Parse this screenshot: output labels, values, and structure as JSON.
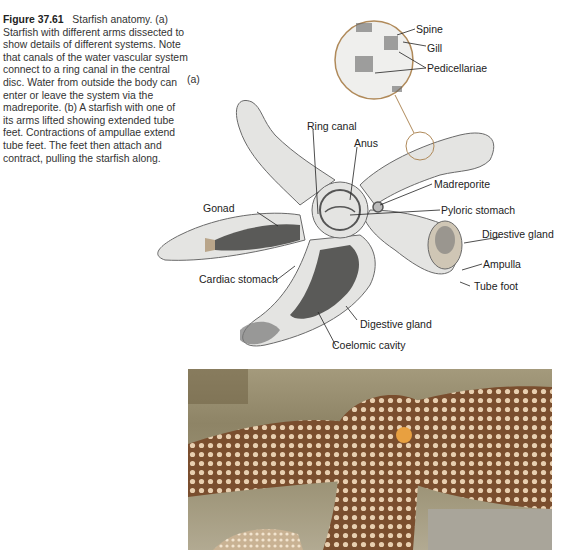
{
  "caption": {
    "figure_number": "Figure 37.61",
    "title": "Starfish anatomy.",
    "body": "(a) Starfish with different arms dissected to show details of different systems. Note that canals of the water vascular system connect to a ring canal in the central disc. Water from outside the body can enter or leave the system via the madreporite. (b) A starfish with one of its arms lifted showing extended tube feet. Contractions of ampullae extend tube feet. The feet then attach and contract, pulling the starfish along."
  },
  "part_label_a": "(a)",
  "diagram": {
    "inset_labels": {
      "spine": "Spine",
      "gill": "Gill",
      "pedicellariae": "Pedicellariae"
    },
    "labels": {
      "ring_canal": "Ring canal",
      "anus": "Anus",
      "madreporite": "Madreporite",
      "pyloric_stomach": "Pyloric stomach",
      "gonad": "Gonad",
      "digestive_gland_right": "Digestive gland",
      "ampulla": "Ampulla",
      "tube_foot": "Tube foot",
      "cardiac_stomach": "Cardiac stomach",
      "digestive_gland_bottom": "Digestive gland",
      "coelomic_cavity": "Coelomic cavity"
    },
    "colors": {
      "outline": "#6a6a6a",
      "body_fill": "#e4e4e2",
      "inset_ring": "#b08a5a",
      "gonad_fill": "#5a5a58",
      "tissue_tan": "#b9a58a"
    }
  },
  "photo": {
    "description": "Photograph of a starfish with an arm lifted showing extended tube feet",
    "colors": {
      "body": "#7a4e2e",
      "spines": "#e8cfb0",
      "madreporite": "#e8a040",
      "rock": "#9a9174"
    }
  }
}
